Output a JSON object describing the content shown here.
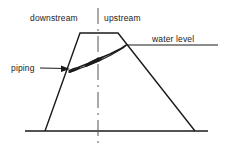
{
  "diagram": {
    "type": "cross-section-schematic",
    "background_color": "#ffffff",
    "line_color": "#1a1a1a",
    "labels": {
      "downstream": "downstream",
      "upstream": "upstream",
      "water_level": "water level",
      "piping": "piping"
    },
    "icons": {
      "leader_arrow": "arrow-right-icon",
      "centerline": "dash-dot-centerline-icon"
    },
    "geometry": {
      "ground_line": {
        "x1": 25,
        "y1": 131,
        "x2": 208,
        "y2": 131
      },
      "crest": {
        "x1": 80,
        "y1": 33,
        "x2": 118,
        "y2": 33
      },
      "downstream_slope": {
        "x1": 45,
        "y1": 131,
        "x2": 80,
        "y2": 33
      },
      "upstream_slope": {
        "x1": 118,
        "y1": 33,
        "x2": 195,
        "y2": 131
      },
      "water_level_line": {
        "x1": 126,
        "y1": 45,
        "x2": 218,
        "y2": 45
      },
      "centerline": {
        "x": 98,
        "y1": 8,
        "y2": 143
      },
      "piping_path": "69,71 78,67 88,63 99,58 110,54 120,49 126,45",
      "piping_arrow_tip": {
        "x": 70,
        "y": 69
      },
      "piping_leader": {
        "x1": 40,
        "y1": 68,
        "x2": 70,
        "y2": 68
      }
    }
  }
}
